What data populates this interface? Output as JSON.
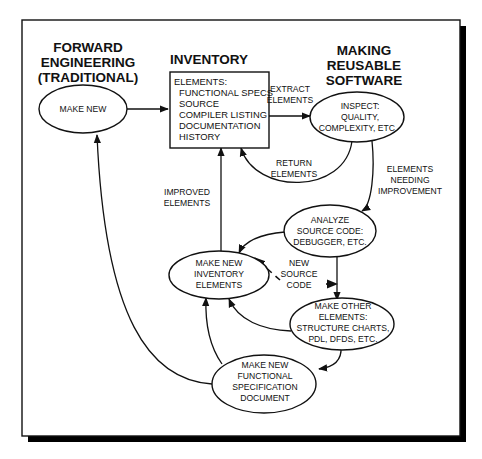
{
  "colors": {
    "ink": "#111111",
    "background": "#ffffff",
    "frame_shadow": "#000000"
  },
  "headings": {
    "forward": [
      "FORWARD",
      "ENGINEERING",
      "(TRADITIONAL)"
    ],
    "inventory": "INVENTORY",
    "reusable": [
      "MAKING",
      "REUSABLE",
      "SOFTWARE"
    ]
  },
  "nodes": {
    "make_new": {
      "lines": [
        "MAKE NEW"
      ]
    },
    "inventory_box": {
      "title": "ELEMENTS:",
      "items": [
        "FUNCTIONAL SPECS",
        "SOURCE",
        "COMPILER LISTING",
        "DOCUMENTATION",
        "HISTORY"
      ]
    },
    "inspect": {
      "lines": [
        "INSPECT:",
        "QUALITY,",
        "COMPLEXITY, ETC."
      ]
    },
    "analyze": {
      "lines": [
        "ANALYZE",
        "SOURCE CODE:",
        "DEBUGGER, ETC."
      ]
    },
    "make_new_inventory": {
      "lines": [
        "MAKE NEW",
        "INVENTORY",
        "ELEMENTS"
      ]
    },
    "make_other": {
      "lines": [
        "MAKE OTHER",
        "ELEMENTS:",
        "STRUCTURE CHARTS,",
        "PDL, DFDS, ETC."
      ]
    },
    "make_new_spec": {
      "lines": [
        "MAKE NEW",
        "FUNCTIONAL",
        "SPECIFICATION",
        "DOCUMENT"
      ]
    }
  },
  "edge_labels": {
    "extract": [
      "EXTRACT",
      "ELEMENTS"
    ],
    "return": [
      "RETURN",
      "ELEMENTS"
    ],
    "needing": [
      "ELEMENTS",
      "NEEDING",
      "IMPROVEMENT"
    ],
    "improved": [
      "IMPROVED",
      "ELEMENTS"
    ],
    "new_source": [
      "NEW",
      "SOURCE",
      "CODE"
    ]
  }
}
